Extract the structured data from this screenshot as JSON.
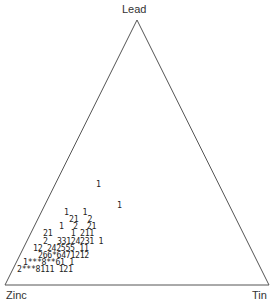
{
  "diagram": {
    "type": "ternary-frequency-plot",
    "vertices": {
      "top": "Lead",
      "bottom_left": "Zinc",
      "bottom_right": "Tin"
    },
    "line_color": "#555555",
    "rows": [
      {
        "text": "1",
        "x": 96,
        "y": 180
      },
      {
        "text": "1",
        "x": 117,
        "y": 201
      },
      {
        "text": "1   1",
        "x": 64,
        "y": 208
      },
      {
        "text": "21  2",
        "x": 69,
        "y": 215
      },
      {
        "text": "1  2  21",
        "x": 59,
        "y": 222
      },
      {
        "text": "21    1 211",
        "x": 43,
        "y": 229
      },
      {
        "text": "2  33124231 1",
        "x": 43,
        "y": 237
      },
      {
        "text": "12 242555 11",
        "x": 33,
        "y": 244
      },
      {
        "text": "266*6471212",
        "x": 38,
        "y": 251
      },
      {
        "text": "1***8**61 1",
        "x": 23,
        "y": 258
      },
      {
        "text": "2***8111 121",
        "x": 17,
        "y": 265
      }
    ]
  }
}
